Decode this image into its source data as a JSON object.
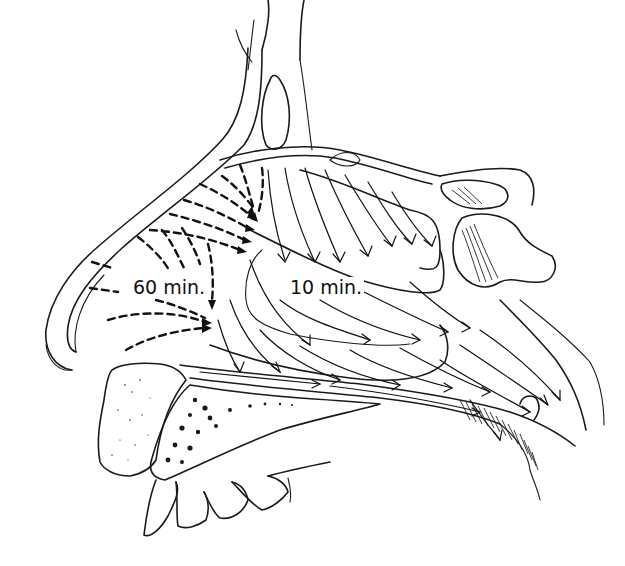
{
  "figure": {
    "labels": {
      "anterior_region_time": "60 min.",
      "posterior_region_time": "10 min."
    },
    "colors": {
      "ink": "#111111",
      "background": "#ffffff"
    },
    "legend_semantics": {
      "dashed_arrows": "slow anterior flow",
      "solid_arrows": "fast posterior flow"
    }
  }
}
